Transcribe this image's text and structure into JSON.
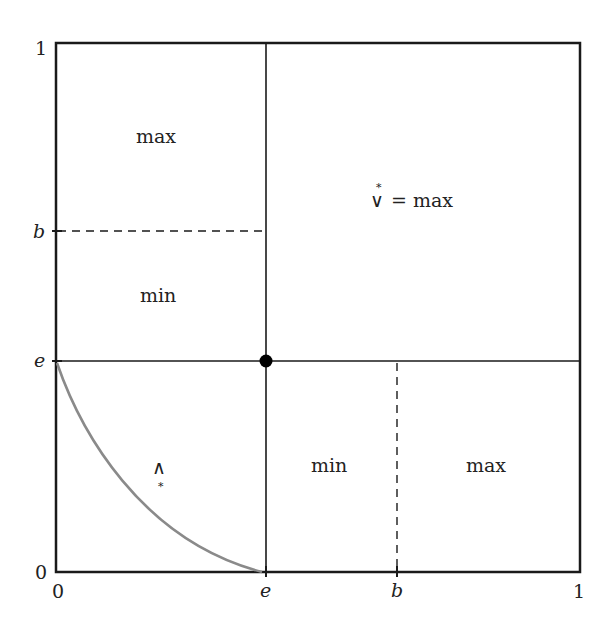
{
  "diagram": {
    "y_axis_ticks": [
      "1",
      "b",
      "e",
      "0"
    ],
    "x_axis_ticks": [
      "0",
      "e",
      "b",
      "1"
    ],
    "regions": {
      "top_left_upper": "max",
      "top_left_lower": "min",
      "top_right": "= max",
      "top_right_symbol": "∨",
      "top_right_star": "*",
      "bottom_left_symbol": "∧",
      "bottom_left_star": "*",
      "bottom_middle": "min",
      "bottom_right": "max"
    },
    "colors": {
      "frame": "#1a1a1a",
      "curve": "#8a8a8a",
      "point": "#000000"
    }
  }
}
